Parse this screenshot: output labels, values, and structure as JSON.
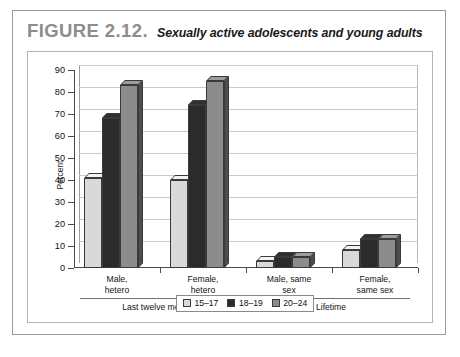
{
  "figure": {
    "number": "FIGURE 2.12.",
    "title": "Sexually active adolescents and young adults"
  },
  "chart_data": {
    "type": "bar",
    "title": "Sexually active adolescents and young adults",
    "xlabel": "",
    "ylabel": "Percent",
    "ylim": [
      0,
      90
    ],
    "ytick_step": 10,
    "yticks": [
      "0",
      "10",
      "20",
      "30",
      "40",
      "50",
      "60",
      "70",
      "80",
      "90"
    ],
    "grid": true,
    "legend_position": "bottom-center",
    "categories": [
      "Male, hetero",
      "Female, hetero",
      "Male, same sex",
      "Female, same sex"
    ],
    "category_lines": [
      [
        "Male,",
        "hetero"
      ],
      [
        "Female,",
        "hetero"
      ],
      [
        "Male, same",
        "sex"
      ],
      [
        "Female,",
        "same sex"
      ]
    ],
    "series": [
      {
        "name": "15–17",
        "color": "#d9d9d9",
        "values": [
          41,
          40,
          3,
          8
        ]
      },
      {
        "name": "18–19",
        "color": "#2b2b2b",
        "values": [
          68,
          74,
          5,
          13
        ]
      },
      {
        "name": "20–24",
        "color": "#8c8c8c",
        "values": [
          83,
          85,
          5,
          13
        ]
      }
    ],
    "group_brackets": [
      {
        "label": "Last twelve months",
        "categories": [
          "Male, hetero",
          "Female, hetero"
        ]
      },
      {
        "label": "Lifetime",
        "categories": [
          "Male, same sex",
          "Female, same sex"
        ]
      }
    ]
  }
}
